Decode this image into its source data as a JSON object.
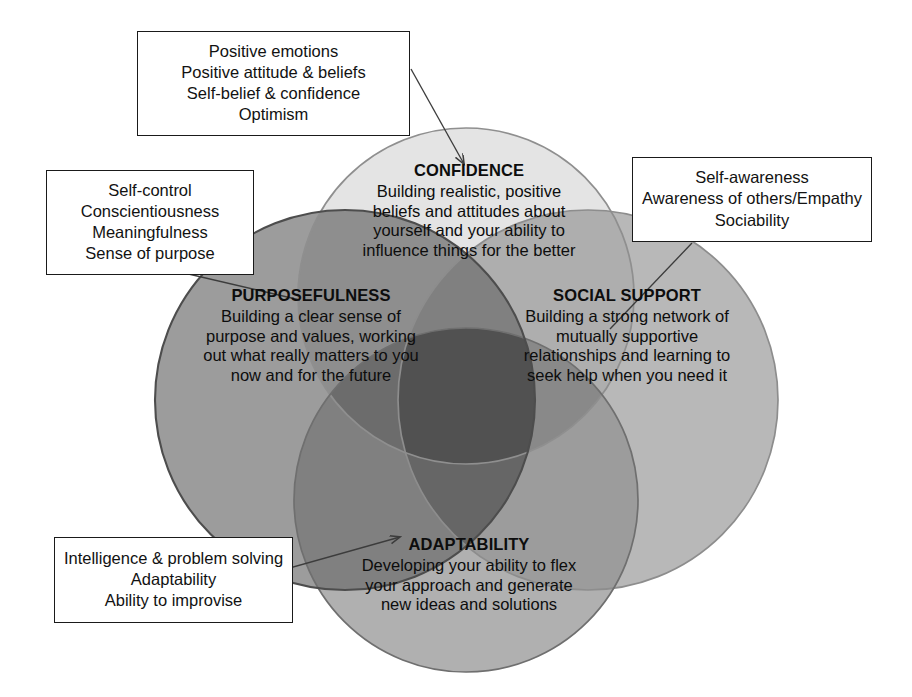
{
  "diagram": {
    "type": "venn",
    "background": "#ffffff"
  },
  "circles": [
    {
      "key": "confidence",
      "title": "CONFIDENCE",
      "description_lines": [
        "Building realistic, positive",
        "beliefs and attitudes about",
        "yourself and your ability to",
        "influence things for the better"
      ],
      "fill": "#e2e2e2",
      "stroke": "#8c8c8c",
      "cx": 466,
      "cy": 296,
      "r": 168
    },
    {
      "key": "purposefulness",
      "title": "PURPOSEFULNESS",
      "description_lines": [
        "Building a clear sense of",
        "purpose and values, working",
        "out what really matters to you",
        "now and for the future"
      ],
      "fill": "#9a9a9a",
      "stroke": "#4a4a4a",
      "cx": 345,
      "cy": 400,
      "r": 190
    },
    {
      "key": "social-support",
      "title": "SOCIAL SUPPORT",
      "description_lines": [
        "Building a strong network of",
        "mutually supportive",
        "relationships and learning to",
        "seek help when you need it"
      ],
      "fill": "#b4b4b4",
      "stroke": "#8a8a8a",
      "cx": 588,
      "cy": 400,
      "r": 190
    },
    {
      "key": "adaptability",
      "title": "ADAPTABILITY",
      "description_lines": [
        "Developing your ability to flex",
        "your approach and generate",
        "new ideas and solutions"
      ],
      "fill": "#adadad",
      "stroke": "#6e6e6e",
      "cx": 466,
      "cy": 500,
      "r": 172
    }
  ],
  "callouts": [
    {
      "key": "confidence",
      "lines": [
        "Positive emotions",
        "Positive attitude & beliefs",
        "Self-belief & confidence",
        "Optimism"
      ],
      "connector": "arrow"
    },
    {
      "key": "purposefulness",
      "lines": [
        "Self-control",
        "Conscientiousness",
        "Meaningfulness",
        "Sense of purpose"
      ],
      "connector": "line"
    },
    {
      "key": "social-support",
      "lines": [
        "Self-awareness",
        "Awareness of others/Empathy",
        "Sociability"
      ],
      "connector": "line"
    },
    {
      "key": "adaptability",
      "lines": [
        "Intelligence & problem solving",
        "Adaptability",
        "Ability to improvise"
      ],
      "connector": "arrow"
    }
  ],
  "colors": {
    "text": "#111111",
    "box_border": "#1a1a1a",
    "connector": "#3c3c3c",
    "page_background": "#ffffff"
  }
}
